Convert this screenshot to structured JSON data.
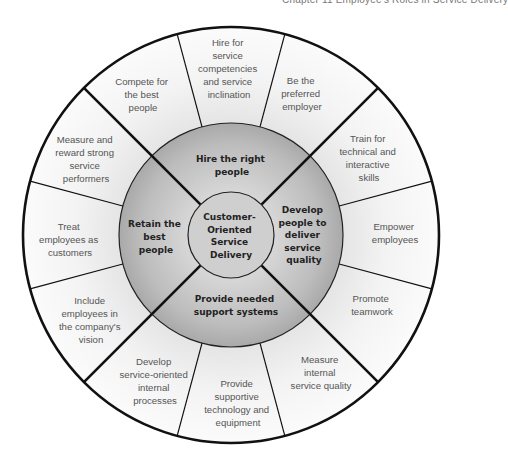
{
  "header": {
    "running_title": "Chapter 11   Employee's Roles in Service Delivery"
  },
  "diagram": {
    "center": {
      "lines": [
        "Customer-",
        "Oriented",
        "Service",
        "Delivery"
      ]
    },
    "strategies": [
      {
        "id": "hire",
        "lines": [
          "Hire the right",
          "people"
        ]
      },
      {
        "id": "develop",
        "lines": [
          "Develop",
          "people to",
          "deliver",
          "service",
          "quality"
        ]
      },
      {
        "id": "support",
        "lines": [
          "Provide needed",
          "support systems"
        ]
      },
      {
        "id": "retain",
        "lines": [
          "Retain the",
          "best",
          "people"
        ]
      }
    ],
    "tactics": [
      {
        "strategy": "hire",
        "lines": [
          "Compete for",
          "the best",
          "people"
        ]
      },
      {
        "strategy": "hire",
        "lines": [
          "Hire for",
          "service",
          "competencies",
          "and service",
          "inclination"
        ]
      },
      {
        "strategy": "hire",
        "lines": [
          "Be the",
          "preferred",
          "employer"
        ]
      },
      {
        "strategy": "develop",
        "lines": [
          "Train for",
          "technical and",
          "interactive",
          "skills"
        ]
      },
      {
        "strategy": "develop",
        "lines": [
          "Empower",
          "employees"
        ]
      },
      {
        "strategy": "develop",
        "lines": [
          "Promote",
          "teamwork"
        ]
      },
      {
        "strategy": "support",
        "lines": [
          "Measure",
          "internal",
          "service quality"
        ]
      },
      {
        "strategy": "support",
        "lines": [
          "Provide",
          "supportive",
          "technology and",
          "equipment"
        ]
      },
      {
        "strategy": "support",
        "lines": [
          "Develop",
          "service-oriented",
          "internal",
          "processes"
        ]
      },
      {
        "strategy": "retain",
        "lines": [
          "Include",
          "employees in",
          "the company's",
          "vision"
        ]
      },
      {
        "strategy": "retain",
        "lines": [
          "Treat",
          "employees as",
          "customers"
        ]
      },
      {
        "strategy": "retain",
        "lines": [
          "Measure and",
          "reward strong",
          "service",
          "performers"
        ]
      }
    ],
    "colors": {
      "outer_ring": "#f1f1f1",
      "middle_ring": "#b9b9b9",
      "core": "#cdcdcd",
      "lines": "#111111",
      "outer_text": "#555555",
      "inner_text": "#222222"
    }
  }
}
